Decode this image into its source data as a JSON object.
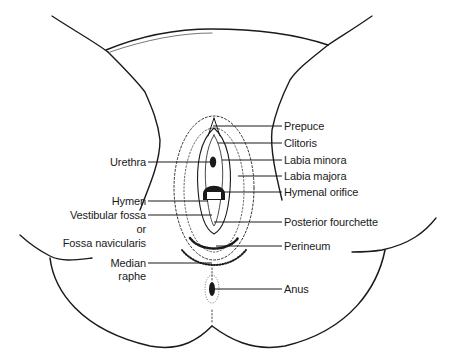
{
  "figure": {
    "type": "anatomical line drawing",
    "line_color": "#1a1a1a",
    "background": "#ffffff"
  },
  "labels": {
    "right": [
      {
        "text": "Prepuce"
      },
      {
        "text": "Clitoris"
      },
      {
        "text": "Labia minora"
      },
      {
        "text": "Labia majora"
      },
      {
        "text": "Hymenal orifice"
      },
      {
        "text": "Posterior fourchette"
      },
      {
        "text": "Perineum"
      },
      {
        "text": "Anus"
      }
    ],
    "left": [
      {
        "text": "Urethra"
      },
      {
        "text": "Hymen"
      },
      {
        "text": "Vestibular fossa"
      },
      {
        "text": "or"
      },
      {
        "text": "Fossa navicularis"
      },
      {
        "text": "Median"
      },
      {
        "text": "raphe"
      }
    ]
  }
}
